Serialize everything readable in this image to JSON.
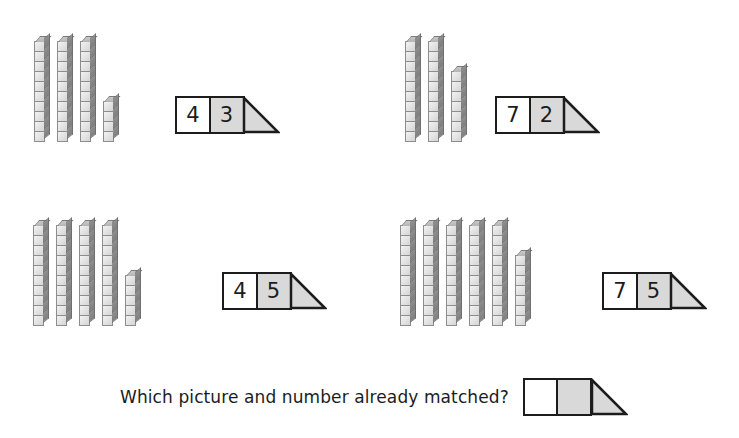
{
  "worksheet": {
    "title": "Place value matching: base-ten blocks and number cards",
    "question": {
      "text": "Which picture and number already matched?",
      "answer_card": {
        "tens_value": "",
        "ones_value": "",
        "tens_fill": "#ffffff",
        "ones_fill": "#d9d9d9",
        "triangle_fill": "#d9d9d9"
      }
    },
    "colors": {
      "ink": "#1c1c1c",
      "cube_face": "#e8e8e8",
      "cube_side": "#868686",
      "cube_top": "#bfbfbf",
      "card_ones_fill": "#d9d9d9",
      "card_tens_fill": "#ffffff",
      "page_background": "#ffffff"
    },
    "groups": [
      {
        "id": "group-1",
        "position": "top-left",
        "blocks": {
          "ten_rods": 3,
          "ones_cubes": 4,
          "cubes_per_rod": 10,
          "blocks_value": 34,
          "rod_lengths": [
            10,
            10,
            10,
            4
          ]
        },
        "card": {
          "tens_digit": "4",
          "ones_digit": "3",
          "card_value": 43
        },
        "matches": false
      },
      {
        "id": "group-2",
        "position": "top-right",
        "blocks": {
          "ten_rods": 2,
          "ones_cubes": 7,
          "cubes_per_rod": 10,
          "blocks_value": 27,
          "rod_lengths": [
            10,
            10,
            7
          ]
        },
        "card": {
          "tens_digit": "7",
          "ones_digit": "2",
          "card_value": 72
        },
        "matches": false
      },
      {
        "id": "group-3",
        "position": "bottom-left",
        "blocks": {
          "ten_rods": 4,
          "ones_cubes": 5,
          "cubes_per_rod": 10,
          "blocks_value": 45,
          "rod_lengths": [
            10,
            10,
            10,
            10,
            5
          ]
        },
        "card": {
          "tens_digit": "4",
          "ones_digit": "5",
          "card_value": 45
        },
        "matches": true
      },
      {
        "id": "group-4",
        "position": "bottom-right",
        "blocks": {
          "ten_rods": 5,
          "ones_cubes": 7,
          "cubes_per_rod": 10,
          "blocks_value": 57,
          "rod_lengths": [
            10,
            10,
            10,
            10,
            10,
            7
          ]
        },
        "card": {
          "tens_digit": "7",
          "ones_digit": "5",
          "card_value": 75
        },
        "matches": false
      }
    ]
  }
}
